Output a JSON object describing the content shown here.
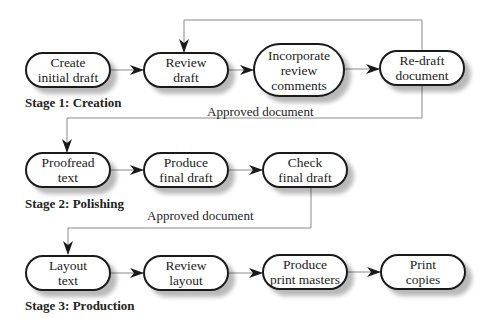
{
  "diagram": {
    "stages": [
      {
        "label": "Stage 1: Creation",
        "nodes": [
          {
            "id": "create",
            "label": "Create\ninitial draft"
          },
          {
            "id": "review",
            "label": "Review\ndraft"
          },
          {
            "id": "incorporate",
            "label": "Incorporate\nreview\ncomments"
          },
          {
            "id": "redraft",
            "label": "Re-draft\ndocument"
          }
        ]
      },
      {
        "label": "Stage 2: Polishing",
        "nodes": [
          {
            "id": "proofread",
            "label": "Proofread\ntext"
          },
          {
            "id": "produce_final",
            "label": "Produce\nfinal draft"
          },
          {
            "id": "check_final",
            "label": "Check\nfinal draft"
          }
        ]
      },
      {
        "label": "Stage 3: Production",
        "nodes": [
          {
            "id": "layout",
            "label": "Layout\ntext"
          },
          {
            "id": "review_layout",
            "label": "Review\nlayout"
          },
          {
            "id": "print_masters",
            "label": "Produce\nprint masters"
          },
          {
            "id": "print_copies",
            "label": "Print\ncopies"
          }
        ]
      }
    ],
    "flow_labels": [
      {
        "text": "Approved document"
      },
      {
        "text": "Approved document"
      }
    ],
    "edges": [
      [
        "create",
        "review"
      ],
      [
        "review",
        "incorporate"
      ],
      [
        "incorporate",
        "redraft"
      ],
      [
        "redraft",
        "review"
      ],
      [
        "redraft",
        "proofread"
      ],
      [
        "proofread",
        "produce_final"
      ],
      [
        "produce_final",
        "check_final"
      ],
      [
        "check_final",
        "layout"
      ],
      [
        "layout",
        "review_layout"
      ],
      [
        "review_layout",
        "print_masters"
      ],
      [
        "print_masters",
        "print_copies"
      ]
    ],
    "colors": {
      "stroke": "#1a1a1a",
      "connector": "#888888",
      "background": "#ffffff"
    }
  }
}
